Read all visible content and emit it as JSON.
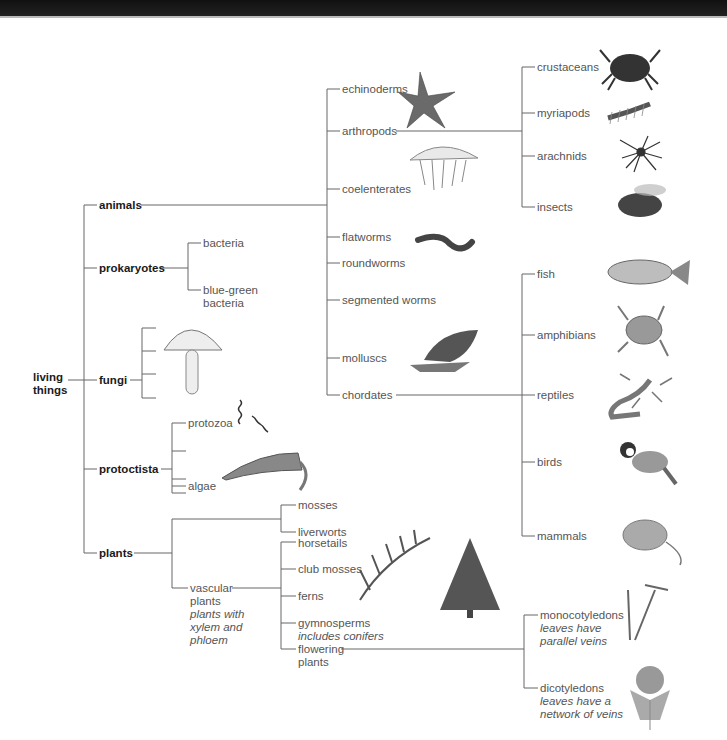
{
  "root": {
    "label_1": "living",
    "label_2": "things"
  },
  "kingdoms": {
    "animals": "animals",
    "prokaryotes": "prokaryotes",
    "fungi": "fungi",
    "protoctista": "protoctista",
    "plants": "plants"
  },
  "prokaryotes": {
    "bacteria": "bacteria",
    "blue_green_1": "blue-green",
    "blue_green_2": "bacteria"
  },
  "protoctista": {
    "protozoa": "protozoa",
    "algae": "algae"
  },
  "animal_phyla": {
    "echinoderms": "echinoderms",
    "arthropods": "arthropods",
    "coelenterates": "coelenterates",
    "flatworms": "flatworms",
    "roundworms": "roundworms",
    "segmented_worms": "segmented worms",
    "molluscs": "molluscs",
    "chordates": "chordates"
  },
  "arthropods": {
    "crustaceans": "crustaceans",
    "myriapods": "myriapods",
    "arachnids": "arachnids",
    "insects": "insects"
  },
  "chordates": {
    "fish": "fish",
    "amphibians": "amphibians",
    "reptiles": "reptiles",
    "birds": "birds",
    "mammals": "mammals"
  },
  "plants": {
    "mosses": "mosses",
    "liverworts": "liverworts",
    "vascular_1": "vascular",
    "vascular_2": "plants",
    "vascular_note_1": "plants with",
    "vascular_note_2": "xylem and",
    "vascular_note_3": "phloem"
  },
  "vascular": {
    "horsetails": "horsetails",
    "club_mosses": "club mosses",
    "ferns": "ferns",
    "gymnosperms": "gymnosperms",
    "gymnosperms_note": "includes conifers",
    "flowering_1": "flowering",
    "flowering_2": "plants"
  },
  "flowering": {
    "monocot": "monocotyledons",
    "monocot_note_1": "leaves have",
    "monocot_note_2": "parallel veins",
    "dicot": "dicotyledons",
    "dicot_note_1": "leaves have a",
    "dicot_note_2": "network of veins"
  },
  "colors": {
    "line": "#555555",
    "bold_text": "#1a1a1a",
    "text": "#555555",
    "topbar": "#151515"
  }
}
